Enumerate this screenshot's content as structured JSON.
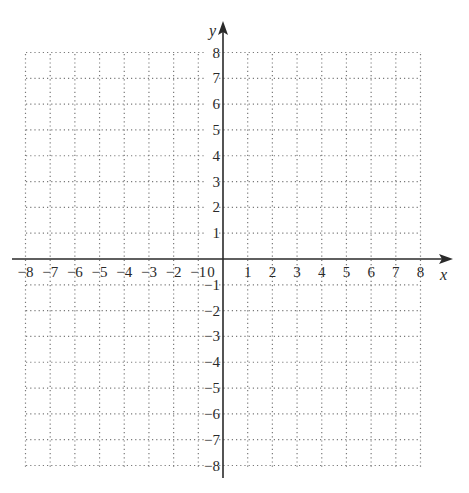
{
  "chart_data": {
    "type": "scatter",
    "title": "",
    "xlabel": "x",
    "ylabel": "y",
    "xlim": [
      -8,
      8
    ],
    "ylim": [
      -8,
      8
    ],
    "grid": true,
    "grid_style": "dotted",
    "x_ticks": [
      -8,
      -7,
      -6,
      -5,
      -4,
      -3,
      -2,
      -1,
      0,
      1,
      2,
      3,
      4,
      5,
      6,
      7,
      8
    ],
    "y_ticks": [
      -8,
      -7,
      -6,
      -5,
      -4,
      -3,
      -2,
      -1,
      1,
      2,
      3,
      4,
      5,
      6,
      7,
      8
    ],
    "x_tick_labels": [
      "−8",
      "−7",
      "−6",
      "−5",
      "−4",
      "−3",
      "−2",
      "−1",
      "1",
      "2",
      "3",
      "4",
      "5",
      "6",
      "7",
      "8"
    ],
    "y_tick_labels": [
      "8",
      "7",
      "6",
      "5",
      "4",
      "3",
      "2",
      "1",
      "−1",
      "−2",
      "−3",
      "−4",
      "−5",
      "−6",
      "−7",
      "−8"
    ],
    "origin_label": "0",
    "series": [],
    "legend": null
  },
  "colors": {
    "axis": "#2a2a2a",
    "grid": "#7a7a7a",
    "background": "#ffffff"
  }
}
